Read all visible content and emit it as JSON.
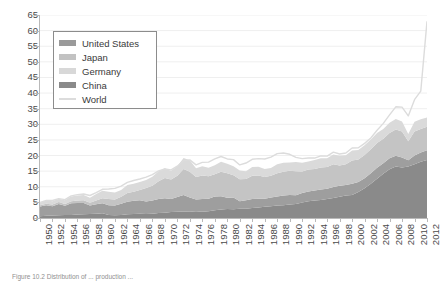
{
  "figure": {
    "caption": "Figure 10.2 Distribution of ... production ..."
  },
  "legend": {
    "position": "upper-left-inside",
    "items": [
      {
        "label": "United States",
        "color": "#9a9a9a",
        "marker": "area"
      },
      {
        "label": "Japan",
        "color": "#c2c2c2",
        "marker": "area"
      },
      {
        "label": "Germany",
        "color": "#d8d8d8",
        "marker": "area"
      },
      {
        "label": "China",
        "color": "#8a8a8a",
        "marker": "area"
      },
      {
        "label": "World",
        "color": "#dcdcdc",
        "marker": "line"
      }
    ]
  },
  "axes": {
    "y_ticks": [
      0,
      5,
      10,
      15,
      20,
      25,
      30,
      35,
      40,
      45,
      50,
      55,
      60,
      65
    ],
    "x_tick_labels": [
      "1950",
      "1952",
      "1954",
      "1956",
      "1958",
      "1960",
      "1962",
      "1964",
      "1966",
      "1968",
      "1970",
      "1972",
      "1974",
      "1976",
      "1978",
      "1980",
      "1982",
      "1984",
      "1986",
      "1988",
      "1990",
      "1992",
      "1994",
      "1996",
      "1998",
      "2000",
      "2002",
      "2004",
      "2006",
      "2008",
      "2010",
      "2012"
    ]
  },
  "chart_data": {
    "type": "area",
    "title": "",
    "xlabel": "",
    "ylabel": "",
    "ylim": [
      0,
      65
    ],
    "xlim": [
      1950,
      2012
    ],
    "grid": true,
    "stacked": true,
    "stack_order": [
      "China",
      "United States",
      "Japan",
      "Germany"
    ],
    "legend_position": "upper left",
    "x": [
      1950,
      1951,
      1952,
      1953,
      1954,
      1955,
      1956,
      1957,
      1958,
      1959,
      1960,
      1961,
      1962,
      1963,
      1964,
      1965,
      1966,
      1967,
      1968,
      1969,
      1970,
      1971,
      1972,
      1973,
      1974,
      1975,
      1976,
      1977,
      1978,
      1979,
      1980,
      1981,
      1982,
      1983,
      1984,
      1985,
      1986,
      1987,
      1988,
      1989,
      1990,
      1991,
      1992,
      1993,
      1994,
      1995,
      1996,
      1997,
      1998,
      1999,
      2000,
      2001,
      2002,
      2003,
      2004,
      2005,
      2006,
      2007,
      2008,
      2009,
      2010,
      2011,
      2012
    ],
    "series": [
      {
        "name": "China",
        "color": "#8a8a8a",
        "values": [
          0.1,
          0.2,
          0.3,
          0.4,
          0.5,
          0.6,
          0.7,
          0.8,
          1.1,
          1.4,
          1.6,
          1.0,
          0.8,
          0.9,
          1.1,
          1.3,
          1.5,
          1.2,
          1.3,
          1.6,
          1.8,
          2.1,
          2.3,
          2.5,
          2.4,
          2.6,
          2.3,
          2.6,
          3.1,
          3.4,
          3.7,
          3.6,
          4.0,
          4.0,
          4.3,
          4.7,
          5.2,
          5.6,
          5.9,
          6.1,
          6.6,
          7.1,
          8.1,
          8.9,
          9.3,
          9.5,
          10.1,
          10.8,
          11.6,
          12.4,
          12.9,
          15.1,
          18.3,
          22.2,
          27.3,
          35.6,
          42.2,
          48.9,
          50.1,
          57.2,
          63.7,
          68.3,
          71.7
        ]
      },
      {
        "name": "United States",
        "color": "#9a9a9a",
        "values": [
          87.8,
          95.4,
          84.5,
          101.3,
          80.1,
          106.2,
          104.5,
          102.3,
          77.3,
          84.8,
          90.1,
          88.9,
          89.2,
          101.5,
          115.3,
          119.3,
          121.7,
          115.4,
          119.3,
          128.2,
          131.5,
          120.4,
          133.2,
          150.8,
          132.2,
          105.8,
          116.1,
          113.7,
          124.3,
          123.9,
          101.5,
          109.6,
          67.7,
          76.8,
          83.9,
          80.1,
          74.0,
          80.9,
          83.9,
          88.8,
          89.7,
          79.7,
          84.3,
          88.8,
          91.2,
          95.2,
          95.5,
          98.5,
          98.7,
          97.4,
          101.8,
          90.1,
          91.6,
          93.7,
          99.7,
          94.9,
          98.6,
          98.1,
          91.4,
          58.2,
          80.5,
          86.2,
          88.7
        ]
      },
      {
        "name": "Japan",
        "color": "#c2c2c2",
        "values": [
          4.8,
          6.5,
          7.0,
          7.7,
          7.8,
          9.4,
          11.1,
          12.6,
          12.1,
          16.6,
          22.1,
          28.3,
          27.5,
          31.5,
          39.8,
          41.2,
          47.8,
          62.2,
          66.9,
          82.2,
          93.3,
          88.6,
          96.9,
          119.3,
          117.1,
          102.3,
          107.4,
          102.4,
          102.1,
          111.7,
          111.4,
          101.7,
          99.5,
          97.2,
          105.6,
          105.3,
          98.3,
          98.5,
          105.7,
          107.9,
          110.3,
          109.6,
          98.1,
          99.6,
          98.3,
          101.6,
          98.8,
          104.5,
          93.5,
          94.2,
          106.4,
          102.9,
          107.7,
          110.5,
          112.7,
          112.5,
          116.2,
          120.2,
          118.7,
          87.5,
          109.6,
          107.6,
          107.2
        ]
      },
      {
        "name": "Germany",
        "color": "#d8d8d8",
        "values": [
          12.1,
          13.5,
          15.8,
          15.4,
          17.4,
          21.3,
          23.2,
          24.5,
          22.8,
          29.4,
          34.1,
          33.5,
          32.6,
          31.6,
          37.3,
          36.8,
          35.3,
          36.7,
          41.2,
          45.3,
          45.0,
          40.3,
          43.7,
          49.5,
          53.2,
          40.4,
          42.4,
          39.0,
          41.3,
          46.0,
          43.8,
          41.6,
          39.5,
          35.7,
          39.4,
          40.5,
          37.1,
          36.2,
          41.0,
          41.0,
          38.4,
          42.2,
          39.7,
          37.6,
          40.8,
          42.1,
          39.8,
          45.0,
          44.0,
          42.1,
          46.4,
          44.8,
          45.0,
          44.8,
          46.4,
          44.5,
          47.2,
          48.6,
          45.8,
          32.7,
          43.8,
          44.3,
          42.7
        ]
      },
      {
        "name": "World",
        "color": "#dcdcdc",
        "type": "line",
        "values": [
          189.0,
          211.0,
          211.0,
          235.0,
          223.0,
          270.0,
          283.0,
          292.0,
          272.0,
          305.0,
          347.0,
          353.0,
          360.0,
          386.0,
          433.0,
          455.0,
          472.0,
          494.0,
          524.0,
          571.0,
          595.0,
          582.0,
          630.0,
          697.0,
          703.0,
          644.0,
          675.0,
          676.0,
          717.0,
          747.0,
          716.0,
          707.0,
          645.0,
          664.0,
          710.0,
          719.0,
          714.0,
          736.0,
          780.0,
          786.0,
          770.0,
          734.0,
          720.0,
          728.0,
          725.0,
          753.0,
          751.0,
          799.0,
          777.0,
          789.0,
          848.0,
          851.0,
          904.0,
          970.0,
          1063.0,
          1147.0,
          1250.0,
          1348.0,
          1343.0,
          1238.0,
          1433.0,
          1538.0,
          1560.0
        ]
      }
    ],
    "value_note": "Series rendered on chart are scaled index values; stacked bands reach ~33 at 2012 and World line reaches ~63 at 2012."
  },
  "render": {
    "stacked_bands": {
      "china": [
        0.6,
        0.7,
        0.8,
        0.9,
        1.0,
        1.0,
        1.1,
        1.2,
        1.3,
        1.4,
        1.5,
        1.0,
        0.9,
        1.0,
        1.2,
        1.3,
        1.4,
        1.3,
        1.4,
        1.6,
        1.7,
        1.9,
        2.0,
        2.1,
        2.0,
        2.2,
        2.0,
        2.2,
        2.5,
        2.7,
        2.9,
        2.8,
        3.0,
        3.0,
        3.2,
        3.4,
        3.6,
        3.8,
        4.0,
        4.1,
        4.3,
        4.5,
        5.0,
        5.4,
        5.6,
        5.8,
        6.1,
        6.4,
        6.8,
        7.2,
        7.4,
        8.3,
        9.5,
        11.0,
        12.6,
        14.2,
        15.6,
        16.5,
        16.2,
        16.5,
        17.2,
        18.0,
        18.6
      ],
      "united_states": [
        3.1,
        3.4,
        3.0,
        3.6,
        2.9,
        3.7,
        3.7,
        3.6,
        2.7,
        3.0,
        3.2,
        3.1,
        3.1,
        3.6,
        4.0,
        4.2,
        4.3,
        4.0,
        4.2,
        4.5,
        4.6,
        4.2,
        4.7,
        5.3,
        4.6,
        3.7,
        4.1,
        4.0,
        4.4,
        4.3,
        3.6,
        3.8,
        2.4,
        2.7,
        2.9,
        2.8,
        2.6,
        2.8,
        2.9,
        3.1,
        3.1,
        2.8,
        3.0,
        3.1,
        3.2,
        3.3,
        3.3,
        3.5,
        3.5,
        3.4,
        3.6,
        3.2,
        3.2,
        3.3,
        3.5,
        3.3,
        3.5,
        3.4,
        3.2,
        2.0,
        2.8,
        3.0,
        3.1
      ],
      "japan": [
        0.4,
        0.5,
        0.5,
        0.6,
        0.6,
        0.7,
        0.8,
        0.9,
        0.9,
        1.2,
        1.6,
        2.0,
        1.9,
        2.2,
        2.8,
        2.9,
        3.3,
        4.3,
        4.7,
        5.7,
        6.5,
        6.2,
        6.8,
        8.3,
        8.2,
        7.2,
        7.5,
        7.2,
        7.1,
        7.8,
        7.8,
        7.1,
        7.0,
        6.8,
        7.4,
        7.4,
        6.9,
        6.9,
        7.4,
        7.6,
        7.7,
        7.7,
        6.9,
        7.0,
        6.9,
        7.1,
        6.9,
        7.3,
        6.5,
        6.6,
        7.4,
        7.2,
        7.5,
        7.7,
        7.9,
        7.9,
        8.1,
        8.4,
        8.3,
        6.1,
        7.7,
        7.5,
        7.5
      ],
      "germany": [
        0.9,
        1.0,
        1.1,
        1.1,
        1.2,
        1.5,
        1.6,
        1.7,
        1.6,
        2.1,
        2.4,
        2.3,
        2.3,
        2.2,
        2.6,
        2.6,
        2.5,
        2.6,
        2.9,
        3.2,
        3.1,
        2.8,
        3.1,
        3.5,
        3.7,
        2.8,
        3.0,
        2.7,
        2.9,
        3.2,
        3.1,
        2.9,
        2.8,
        2.5,
        2.8,
        2.8,
        2.6,
        2.5,
        2.9,
        2.9,
        2.7,
        2.9,
        2.8,
        2.6,
        2.9,
        2.9,
        2.8,
        3.1,
        3.1,
        2.9,
        3.2,
        3.1,
        3.1,
        3.1,
        3.2,
        3.1,
        3.3,
        3.4,
        3.2,
        2.3,
        3.1,
        3.1,
        3.0
      ]
    },
    "world_line": [
      5.0,
      5.6,
      5.6,
      6.2,
      5.9,
      7.1,
      7.5,
      7.7,
      7.2,
      8.1,
      9.2,
      9.3,
      9.5,
      10.2,
      11.4,
      12.0,
      12.5,
      13.1,
      13.9,
      15.1,
      15.7,
      15.4,
      16.6,
      18.4,
      18.6,
      17.0,
      17.8,
      17.9,
      18.9,
      19.7,
      18.9,
      18.7,
      17.0,
      17.6,
      18.8,
      19.0,
      18.9,
      19.5,
      20.6,
      20.8,
      20.4,
      19.4,
      19.0,
      19.2,
      19.2,
      19.9,
      19.8,
      21.1,
      20.5,
      20.8,
      22.4,
      22.5,
      23.9,
      25.6,
      28.1,
      30.3,
      33.0,
      35.6,
      35.5,
      32.7,
      37.9,
      40.6,
      63.0
    ]
  }
}
